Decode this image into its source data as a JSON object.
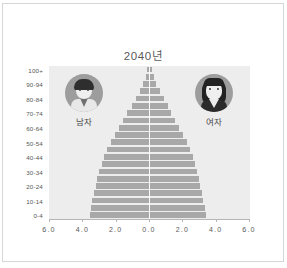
{
  "chart_data": {
    "type": "bar",
    "subtype": "population-pyramid",
    "title": "2040년",
    "xlabel": "",
    "ylabel": "",
    "xlim": [
      -6.0,
      6.0
    ],
    "grid": false,
    "legend_position": "inside-plot",
    "x_tick_labels": [
      "6.0",
      "4.0",
      "2.0",
      "0.0",
      "2.0",
      "4.0",
      "6.0"
    ],
    "x_tick_values": [
      -6.0,
      -4.0,
      -2.0,
      0.0,
      2.0,
      4.0,
      6.0
    ],
    "categories": [
      "0-4",
      "5-9",
      "10-14",
      "15-19",
      "20-24",
      "25-29",
      "30-34",
      "35-39",
      "40-44",
      "45-49",
      "50-54",
      "55-59",
      "60-64",
      "65-69",
      "70-74",
      "75-79",
      "80-84",
      "85-89",
      "90-94",
      "95-99",
      "100+"
    ],
    "y_tick_labels": [
      "0-4",
      "10-14",
      "20-24",
      "30-34",
      "40-44",
      "50-54",
      "60-64",
      "70-74",
      "80-84",
      "90-94",
      "100+"
    ],
    "series": [
      {
        "name": "남자",
        "side": "left",
        "color": "#a8a8a8",
        "values": [
          3.55,
          3.5,
          3.4,
          3.3,
          3.2,
          3.1,
          3.0,
          2.85,
          2.7,
          2.5,
          2.3,
          2.05,
          1.8,
          1.55,
          1.3,
          1.05,
          0.8,
          0.55,
          0.35,
          0.2,
          0.1
        ]
      },
      {
        "name": "여자",
        "side": "right",
        "color": "#a8a8a8",
        "values": [
          3.35,
          3.3,
          3.2,
          3.1,
          3.0,
          2.92,
          2.82,
          2.68,
          2.55,
          2.38,
          2.2,
          1.98,
          1.75,
          1.52,
          1.28,
          1.05,
          0.82,
          0.58,
          0.38,
          0.22,
          0.12
        ]
      }
    ],
    "plot_background": "#ededed",
    "bar_color": "#a8a8a8"
  },
  "legend": {
    "male": {
      "label": "남자",
      "icon": "male-avatar-icon"
    },
    "female": {
      "label": "여자",
      "icon": "female-avatar-icon"
    }
  }
}
